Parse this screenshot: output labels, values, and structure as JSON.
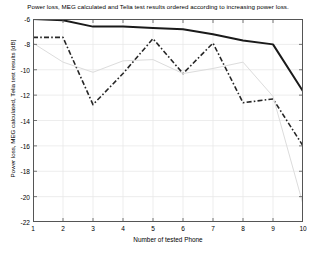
{
  "chart_data": {
    "type": "line",
    "title": "Power loss, MEG calculated and Telia test results ordered according to increasing power loss.",
    "xlabel": "Number of tested Phone",
    "ylabel": "Power loss, MEG calculated, Telia test results [dB]",
    "x": [
      1,
      2,
      3,
      4,
      5,
      6,
      7,
      8,
      9,
      10
    ],
    "xlim": [
      1,
      10
    ],
    "ylim": [
      -22,
      -6
    ],
    "xticks": [
      1,
      2,
      3,
      4,
      5,
      6,
      7,
      8,
      9,
      10
    ],
    "yticks": [
      -6,
      -8,
      -10,
      -12,
      -14,
      -16,
      -18,
      -20,
      -22
    ],
    "ytick_labels": [
      "-6",
      "-8",
      "-10",
      "-12",
      "-14",
      "-16",
      "-18",
      "-20",
      "-22"
    ],
    "xtick_labels": [
      "1",
      "2",
      "3",
      "4",
      "5",
      "6",
      "7",
      "8",
      "9",
      "10"
    ],
    "grid": true,
    "legend": "none",
    "series": [
      {
        "name": "MEG calculated",
        "style": "solid-thick",
        "color": "#1a1a1a",
        "values": [
          -6.0,
          -6.1,
          -6.6,
          -6.6,
          -6.7,
          -6.8,
          -7.2,
          -7.7,
          -8.0,
          -11.7
        ]
      },
      {
        "name": "Telia test results",
        "style": "dash-dot",
        "color": "#262626",
        "values": [
          -7.45,
          -7.45,
          -12.75,
          -10.3,
          -7.55,
          -10.3,
          -7.9,
          -12.6,
          -12.3,
          -16.0
        ]
      },
      {
        "name": "Power loss",
        "style": "solid-thin-light",
        "color": "#dcdcdc",
        "values": [
          -7.9,
          -9.4,
          -10.2,
          -9.3,
          -9.2,
          -10.3,
          -9.9,
          -9.4,
          -12.1,
          -20.6
        ]
      }
    ]
  }
}
